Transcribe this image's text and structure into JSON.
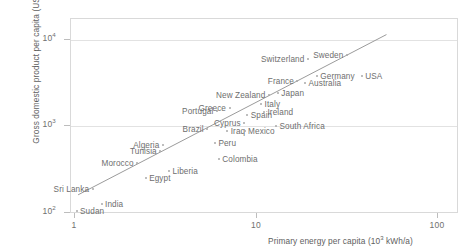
{
  "chart_data": {
    "type": "scatter",
    "title": "",
    "xlabel": "Primary energy per capita (10³ kWh/a)",
    "ylabel": "Gross domestic product per capita (US$/a)",
    "xscale": "log",
    "yscale": "log",
    "xlim": [
      0.78,
      175
    ],
    "ylim": [
      82,
      19000
    ],
    "xticks": [
      "1",
      "10",
      "100"
    ],
    "xtick_values": [
      1,
      10,
      100
    ],
    "yticks": [
      "10²",
      "10³",
      "10⁴"
    ],
    "ytick_values": [
      100,
      1000,
      10000
    ],
    "grid": "horizontal-major-only",
    "legend": "none",
    "marker_color": "#a8a8a8",
    "label_color": "#6e6e6e",
    "frame_color": "#d9d9d9",
    "trend_line": {
      "label": "",
      "color": "#9b9b9b",
      "x_start": 1.04,
      "y_start": 160,
      "x_end": 52,
      "y_end": 11400
    },
    "points": [
      {
        "name": "Sudan",
        "x": 1.02,
        "y": 104,
        "label_pos": "right"
      },
      {
        "name": "India",
        "x": 1.4,
        "y": 124,
        "label_pos": "right"
      },
      {
        "name": "Sri Lanka",
        "x": 1.25,
        "y": 186,
        "label_pos": "left"
      },
      {
        "name": "Egypt",
        "x": 2.45,
        "y": 252,
        "label_pos": "right"
      },
      {
        "name": "Liberia",
        "x": 3.3,
        "y": 300,
        "label_pos": "right"
      },
      {
        "name": "Morocco",
        "x": 2.2,
        "y": 370,
        "label_pos": "left"
      },
      {
        "name": "Tunisia",
        "x": 2.95,
        "y": 510,
        "label_pos": "left"
      },
      {
        "name": "Algeria",
        "x": 3.05,
        "y": 610,
        "label_pos": "left"
      },
      {
        "name": "Colombia",
        "x": 6.2,
        "y": 420,
        "label_pos": "right"
      },
      {
        "name": "Peru",
        "x": 5.9,
        "y": 640,
        "label_pos": "right"
      },
      {
        "name": "Brazil",
        "x": 5.35,
        "y": 930,
        "label_pos": "left"
      },
      {
        "name": "Iraq",
        "x": 6.9,
        "y": 880,
        "label_pos": "right"
      },
      {
        "name": "Portugal",
        "x": 6.05,
        "y": 1480,
        "label_pos": "left"
      },
      {
        "name": "Mexico",
        "x": 8.6,
        "y": 880,
        "label_pos": "right"
      },
      {
        "name": "Cyprus",
        "x": 8.55,
        "y": 1070,
        "label_pos": "left"
      },
      {
        "name": "South Africa",
        "x": 12.8,
        "y": 1010,
        "label_pos": "right"
      },
      {
        "name": "Spain",
        "x": 8.9,
        "y": 1340,
        "label_pos": "right"
      },
      {
        "name": "Greece",
        "x": 7.1,
        "y": 1620,
        "label_pos": "left"
      },
      {
        "name": "Ireland",
        "x": 11.0,
        "y": 1470,
        "label_pos": "right"
      },
      {
        "name": "Italy",
        "x": 10.6,
        "y": 1810,
        "label_pos": "right"
      },
      {
        "name": "New Zealand",
        "x": 11.7,
        "y": 2300,
        "label_pos": "left"
      },
      {
        "name": "Japan",
        "x": 13.1,
        "y": 2400,
        "label_pos": "right"
      },
      {
        "name": "France",
        "x": 16.8,
        "y": 3300,
        "label_pos": "left"
      },
      {
        "name": "Australia",
        "x": 18.5,
        "y": 3150,
        "label_pos": "right"
      },
      {
        "name": "Germany",
        "x": 21.5,
        "y": 3800,
        "label_pos": "right"
      },
      {
        "name": "Switzerland",
        "x": 19.2,
        "y": 5900,
        "label_pos": "left"
      },
      {
        "name": "Sweden",
        "x": 31.5,
        "y": 6700,
        "label_pos": "left"
      },
      {
        "name": "USA",
        "x": 38.0,
        "y": 3800,
        "label_pos": "right"
      }
    ]
  }
}
